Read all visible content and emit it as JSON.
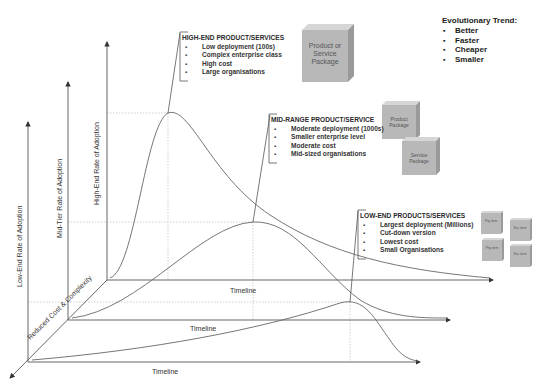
{
  "diagram": {
    "evolutionary_trend": {
      "title": "Evolutionary Trend:",
      "items": [
        "Better",
        "Faster",
        "Cheaper",
        "Smaller"
      ]
    },
    "axes": {
      "high_end_y": "High-End Rate of Adoption",
      "mid_tier_y": "Mid-Tier Rate of Adoption",
      "low_end_y": "Low-End Rate of Adoption",
      "depth": "Reduced Cost & Complexity",
      "timeline_high": "Timeline",
      "timeline_mid": "Timeline",
      "timeline_low": "Timeline"
    },
    "callouts": {
      "high_end": {
        "title": "HIGH-END PRODUCT/SERVICES",
        "items": [
          "Low deployment (100s)",
          "Complex enterprise class",
          "High cost",
          "Large organisations"
        ]
      },
      "mid_range": {
        "title": "MID-RANGE PRODUCT/SERVICE",
        "items": [
          "Moderate deployment (1000s)",
          "Smaller enterprise level",
          "Moderate cost",
          "Mid-sized organisations"
        ]
      },
      "low_end": {
        "title": "LOW-END PRODUCTS/SERVICES",
        "items": [
          "Largest deployment (Millions)",
          "Cut-down version",
          "Lowest cost",
          "Small Organisations"
        ]
      }
    },
    "packages": {
      "high_end": "Product or Service Package",
      "mid_product": "Product Package",
      "mid_service": "Service Package",
      "low_1": "Prg item",
      "low_2": "Svc item",
      "low_3": "Prg item",
      "low_4": "Svc item"
    },
    "colors": {
      "line": "#555555",
      "grid": "#bbbbbb",
      "cube_front": "#b8b8b8",
      "cube_top": "#d6d6d6",
      "cube_side": "#9a9a9a"
    }
  }
}
